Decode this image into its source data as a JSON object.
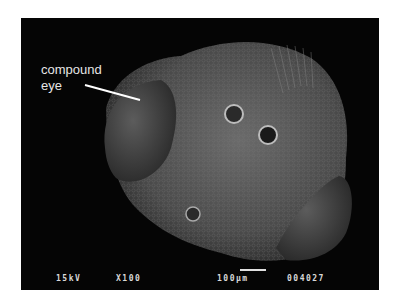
{
  "image": {
    "description": "Scanning electron micrograph of an insect head",
    "annotation": {
      "line1": "compound",
      "line2": "eye"
    },
    "info_bar": {
      "voltage": "15kV",
      "magnification": "X100",
      "scale": "100µm",
      "image_number": "004027"
    },
    "colors": {
      "background": "#050505",
      "specimen": "#5a5a5a",
      "text": "#e6e6e6"
    }
  }
}
